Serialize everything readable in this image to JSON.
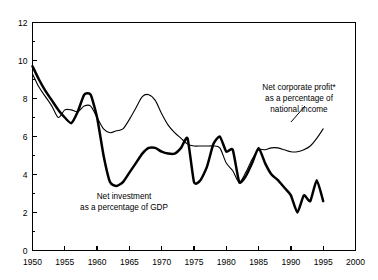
{
  "chart_data": {
    "type": "line",
    "title": "",
    "subtitle": "",
    "xlabel": "",
    "ylabel": "",
    "xlim": [
      1950,
      2000
    ],
    "ylim": [
      0,
      12
    ],
    "grid": false,
    "legend_position": "inline-annotations",
    "x_ticks": [
      1950,
      1955,
      1960,
      1965,
      1970,
      1975,
      1980,
      1985,
      1990,
      1995,
      2000
    ],
    "x_tick_labels": [
      "1950",
      "1955",
      "1960",
      "1965",
      "1970",
      "1975",
      "1980",
      "1985",
      "1990",
      "1995",
      "2000"
    ],
    "y_ticks": [
      0,
      2,
      4,
      6,
      8,
      10,
      12
    ],
    "y_tick_labels": [
      "0",
      "2",
      "4",
      "6",
      "8",
      "10",
      "12"
    ],
    "y_minor_ticks": [
      1,
      3,
      5,
      7,
      9,
      11
    ],
    "series": [
      {
        "name": "Net investment as a percentage of GDP",
        "style": "thick",
        "x": [
          1950,
          1951,
          1952,
          1953,
          1954,
          1955,
          1956,
          1957,
          1958,
          1959,
          1960,
          1961,
          1962,
          1963,
          1964,
          1965,
          1966,
          1967,
          1968,
          1969,
          1970,
          1971,
          1972,
          1973,
          1974,
          1975,
          1976,
          1977,
          1978,
          1979,
          1980,
          1981,
          1982,
          1983,
          1984,
          1985,
          1986,
          1987,
          1988,
          1989,
          1990,
          1991,
          1992,
          1993,
          1994,
          1995
        ],
        "values": [
          9.7,
          9.0,
          8.4,
          7.9,
          7.4,
          7.0,
          6.7,
          7.3,
          8.2,
          8.2,
          7.0,
          5.0,
          3.6,
          3.4,
          3.6,
          4.1,
          4.6,
          5.1,
          5.4,
          5.4,
          5.2,
          5.1,
          5.1,
          5.4,
          5.9,
          3.6,
          3.7,
          4.4,
          5.6,
          6.0,
          5.2,
          5.3,
          3.6,
          3.9,
          4.6,
          5.4,
          4.6,
          4.0,
          3.7,
          3.3,
          2.9,
          2.0,
          2.9,
          2.6,
          3.7,
          2.6
        ]
      },
      {
        "name": "Net corporate profit* as a percentage of national income",
        "style": "thin",
        "x": [
          1950,
          1951,
          1952,
          1953,
          1954,
          1955,
          1956,
          1957,
          1958,
          1959,
          1960,
          1961,
          1962,
          1963,
          1964,
          1965,
          1966,
          1967,
          1968,
          1969,
          1970,
          1971,
          1972,
          1973,
          1974,
          1975,
          1976,
          1977,
          1978,
          1979,
          1980,
          1981,
          1982,
          1983,
          1984,
          1985,
          1986,
          1987,
          1988,
          1989,
          1990,
          1991,
          1992,
          1993,
          1994,
          1995
        ],
        "values": [
          9.3,
          8.6,
          8.1,
          7.6,
          7.0,
          7.4,
          7.4,
          7.3,
          7.6,
          7.6,
          7.0,
          6.4,
          6.2,
          6.3,
          6.4,
          6.9,
          7.5,
          8.1,
          8.2,
          7.9,
          7.2,
          6.6,
          6.2,
          5.9,
          5.6,
          5.5,
          5.5,
          5.5,
          5.5,
          5.4,
          4.6,
          4.2,
          3.6,
          4.1,
          4.8,
          5.3,
          5.3,
          5.4,
          5.4,
          5.3,
          5.2,
          5.2,
          5.3,
          5.5,
          5.9,
          6.4
        ]
      }
    ],
    "annotations": [
      {
        "id": "net-investment-label",
        "lines": [
          "Net investment",
          "as a percentage of GDP"
        ],
        "x": 124,
        "y": 199
      },
      {
        "id": "net-corporate-profit-label",
        "lines": [
          "Net corporate profit*",
          "as a percentage of",
          "national income"
        ],
        "x": 299,
        "y": 90
      }
    ]
  }
}
